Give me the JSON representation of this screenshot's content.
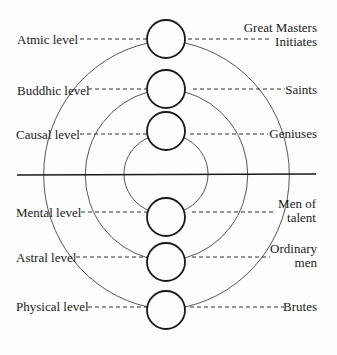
{
  "diagram": {
    "type": "concentric levels of consciousness",
    "colors": {
      "ink": "#1a1a1a",
      "arc": "#444444",
      "background": "#fdfdfd"
    },
    "left_labels": [
      {
        "text": "Atmic level",
        "y": 44
      },
      {
        "text": "Buddhic level",
        "y": 95
      },
      {
        "text": "Causal level",
        "y": 139
      },
      {
        "text": "Mental level",
        "y": 217
      },
      {
        "text": "Astral level",
        "y": 262
      },
      {
        "text": "Physical level",
        "y": 311
      }
    ],
    "right_labels": [
      {
        "lines": [
          "Great Masters",
          "Initiates"
        ],
        "y": 32
      },
      {
        "lines": [
          "Saints"
        ],
        "y": 94
      },
      {
        "lines": [
          "Geniuses"
        ],
        "y": 138
      },
      {
        "lines": [
          "Men of",
          "talent"
        ],
        "y": 208
      },
      {
        "lines": [
          "Ordinary",
          "men"
        ],
        "y": 252
      },
      {
        "lines": [
          "Brutes"
        ],
        "y": 310
      }
    ],
    "circles_y": [
      39,
      89,
      131,
      217,
      262,
      310
    ],
    "divider_label": ""
  }
}
